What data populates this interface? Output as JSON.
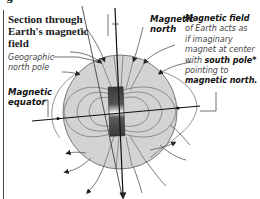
{
  "diagram": {
    "title_lines": [
      "Section through",
      "Earth's magnetic",
      "field"
    ],
    "clipped_top_text": "g",
    "labels": {
      "geographic_north_pole": [
        "Geographic",
        "north pole"
      ],
      "magnetic_equator": [
        "Magnetic",
        "equator"
      ],
      "magnetic_north": [
        "Magnetic",
        "north"
      ]
    },
    "note": {
      "heading": "Magnetic field",
      "line1": "of Earth acts as",
      "line2": "if imaginary",
      "line3": "magnet at center",
      "line4_prefix": "with ",
      "line4_bold": "south pole*",
      "line5": "pointing to",
      "line6_bold": "magnetic north",
      "line6_suffix": "."
    },
    "colors": {
      "sphere_fill": "#d3d3d3",
      "sphere_stroke": "#7a7a7a",
      "field_line": "#6e6e6e",
      "magnet_dark": "#3e3e3e",
      "magnet_light": "#e8e8e8",
      "axis_line": "#222222",
      "text": "#1a1a1a",
      "italic_text": "#444444"
    }
  }
}
